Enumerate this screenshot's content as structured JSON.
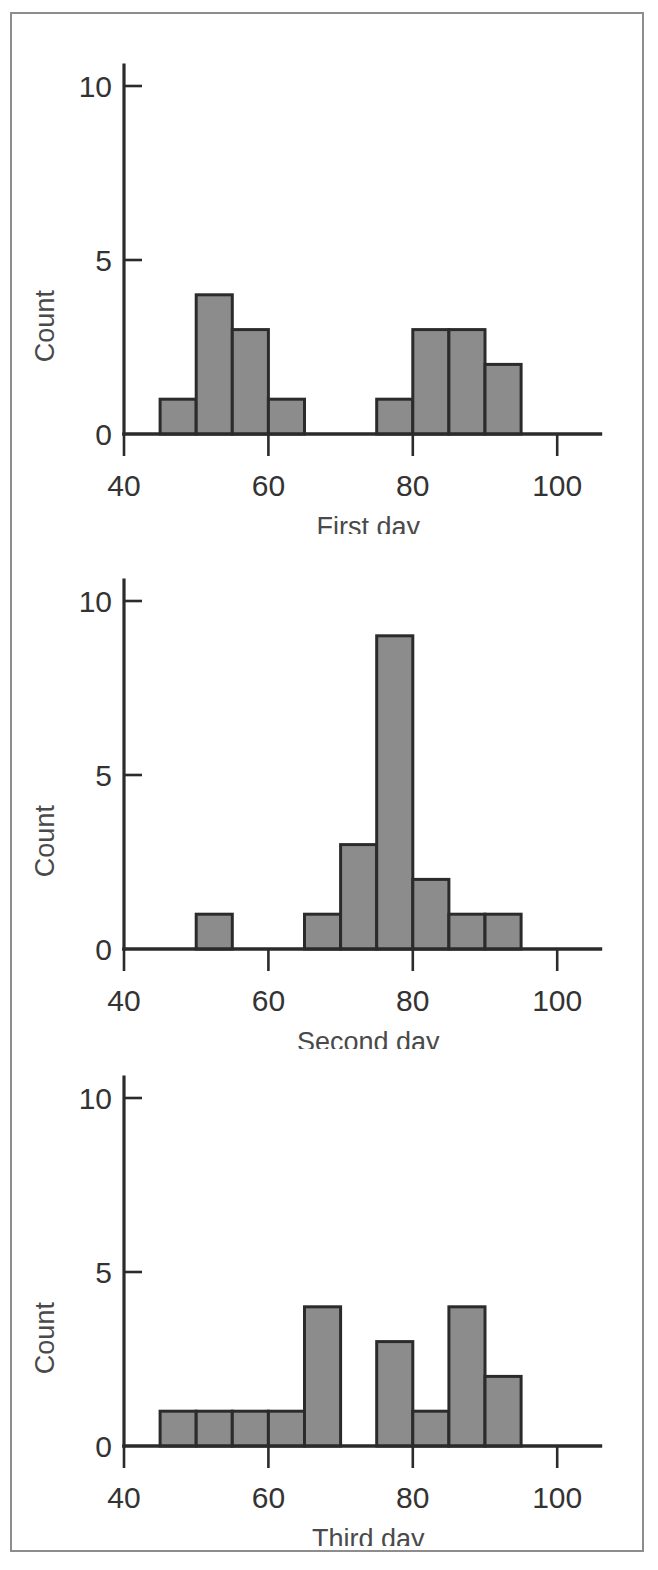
{
  "figure": {
    "background_color": "#ffffff",
    "frame_color": "#8d8d8d",
    "bar_fill_color": "#8c8c8c",
    "bar_edge_color": "#2b2b2b",
    "axis_color": "#2b2b2b",
    "panel_count": 3
  },
  "chart_data": [
    {
      "type": "bar",
      "title": "",
      "xlabel": "First day",
      "ylabel": "Count",
      "xlim": [
        40,
        106
      ],
      "ylim": [
        0,
        10.6
      ],
      "xticks": [
        40,
        60,
        80,
        100
      ],
      "xtick_labels": [
        "40",
        "60",
        "80",
        "100"
      ],
      "yticks": [
        0,
        5,
        10
      ],
      "ytick_labels": [
        "0",
        "5",
        "10"
      ],
      "grid": false,
      "legend": "none",
      "bin_width": 5,
      "bin_edges": [
        45,
        50,
        55,
        60,
        65,
        70,
        75,
        80,
        85,
        90,
        95
      ],
      "categories": [
        "45-50",
        "50-55",
        "55-60",
        "60-65",
        "65-70",
        "70-75",
        "75-80",
        "80-85",
        "85-90",
        "90-95"
      ],
      "values": [
        1,
        4,
        3,
        1,
        0,
        0,
        1,
        3,
        3,
        2
      ]
    },
    {
      "type": "bar",
      "title": "",
      "xlabel": "Second day",
      "ylabel": "Count",
      "xlim": [
        40,
        106
      ],
      "ylim": [
        0,
        10.6
      ],
      "xticks": [
        40,
        60,
        80,
        100
      ],
      "xtick_labels": [
        "40",
        "60",
        "80",
        "100"
      ],
      "yticks": [
        0,
        5,
        10
      ],
      "ytick_labels": [
        "0",
        "5",
        "10"
      ],
      "grid": false,
      "legend": "none",
      "bin_width": 5,
      "bin_edges": [
        50,
        55,
        60,
        65,
        70,
        75,
        80,
        85,
        90,
        95
      ],
      "categories": [
        "50-55",
        "55-60",
        "60-65",
        "65-70",
        "70-75",
        "75-80",
        "80-85",
        "85-90",
        "90-95"
      ],
      "values": [
        1,
        0,
        0,
        1,
        3,
        9,
        2,
        1,
        1
      ]
    },
    {
      "type": "bar",
      "title": "",
      "xlabel": "Third day",
      "ylabel": "Count",
      "xlim": [
        40,
        106
      ],
      "ylim": [
        0,
        10.6
      ],
      "xticks": [
        40,
        60,
        80,
        100
      ],
      "xtick_labels": [
        "40",
        "60",
        "80",
        "100"
      ],
      "yticks": [
        0,
        5,
        10
      ],
      "ytick_labels": [
        "0",
        "5",
        "10"
      ],
      "grid": false,
      "legend": "none",
      "bin_width": 5,
      "bin_edges": [
        45,
        50,
        55,
        60,
        65,
        70,
        75,
        80,
        85,
        90,
        95
      ],
      "categories": [
        "45-50",
        "50-55",
        "55-60",
        "60-65",
        "65-70",
        "70-75",
        "75-80",
        "80-85",
        "85-90",
        "90-95"
      ],
      "values": [
        1,
        1,
        1,
        1,
        4,
        0,
        3,
        1,
        4,
        2
      ]
    }
  ]
}
